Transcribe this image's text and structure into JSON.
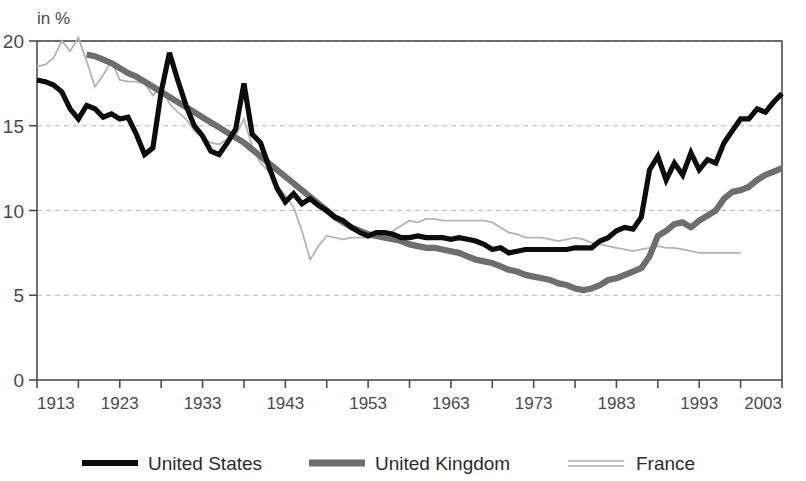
{
  "chart_data": {
    "type": "line",
    "title": "",
    "subtitle": "",
    "unit_label": "in %",
    "xlabel": "",
    "ylabel": "",
    "xlim": [
      1913,
      2003
    ],
    "ylim": [
      0,
      20
    ],
    "y_ticks": [
      "0",
      "5",
      "10",
      "15",
      "20"
    ],
    "y_tick_values": [
      0,
      5,
      10,
      15,
      20
    ],
    "x_ticks": [
      "1913",
      "1923",
      "1933",
      "1943",
      "1953",
      "1963",
      "1973",
      "1983",
      "1993",
      "2003"
    ],
    "x_tick_values": [
      1913,
      1923,
      1933,
      1943,
      1953,
      1963,
      1973,
      1983,
      1993,
      2003
    ],
    "x_minor_tick_values": [
      1918,
      1928,
      1938,
      1948,
      1958,
      1968,
      1978,
      1988,
      1998
    ],
    "grid": "horizontal-dashed",
    "legend_position": "bottom",
    "colors": {
      "united_states": "#0d0d0d",
      "united_kingdom": "#6e6e6e",
      "france": "#b4b4b4",
      "gridline": "#b9b9b9",
      "axis": "#4d4d4d",
      "background": "#ffffff"
    },
    "series": [
      {
        "name": "United States",
        "color": "#0d0d0d",
        "x": [
          1913,
          1914,
          1915,
          1916,
          1917,
          1918,
          1919,
          1920,
          1921,
          1922,
          1923,
          1924,
          1925,
          1926,
          1927,
          1928,
          1929,
          1930,
          1931,
          1932,
          1933,
          1934,
          1935,
          1936,
          1937,
          1938,
          1939,
          1940,
          1941,
          1942,
          1943,
          1944,
          1945,
          1946,
          1947,
          1948,
          1949,
          1950,
          1951,
          1952,
          1953,
          1954,
          1955,
          1956,
          1957,
          1958,
          1959,
          1960,
          1961,
          1962,
          1963,
          1964,
          1965,
          1966,
          1967,
          1968,
          1969,
          1970,
          1971,
          1972,
          1973,
          1974,
          1975,
          1976,
          1977,
          1978,
          1979,
          1980,
          1981,
          1982,
          1983,
          1984,
          1985,
          1986,
          1987,
          1988,
          1989,
          1990,
          1991,
          1992,
          1993,
          1994,
          1995,
          1996,
          1997,
          1998,
          1999,
          2000,
          2001,
          2002,
          2003
        ],
        "values": [
          17.7,
          17.6,
          17.4,
          17.0,
          16.0,
          15.4,
          16.2,
          16.0,
          15.5,
          15.7,
          15.4,
          15.5,
          14.5,
          13.3,
          13.7,
          17.0,
          19.3,
          17.7,
          16.2,
          15.0,
          14.4,
          13.5,
          13.3,
          14.0,
          14.8,
          17.5,
          14.5,
          14.0,
          12.6,
          11.3,
          10.5,
          11.0,
          10.4,
          10.7,
          10.3,
          10.0,
          9.6,
          9.4,
          9.0,
          8.7,
          8.5,
          8.7,
          8.7,
          8.6,
          8.4,
          8.4,
          8.5,
          8.4,
          8.4,
          8.4,
          8.3,
          8.4,
          8.3,
          8.2,
          8.0,
          7.7,
          7.8,
          7.5,
          7.6,
          7.7,
          7.7,
          7.7,
          7.7,
          7.7,
          7.7,
          7.8,
          7.8,
          7.8,
          8.2,
          8.4,
          8.8,
          9.0,
          8.9,
          9.6,
          12.4,
          13.2,
          11.8,
          12.8,
          12.1,
          13.4,
          12.4,
          13.0,
          12.8,
          14.0,
          14.7,
          15.4,
          15.4,
          16.0,
          15.8,
          16.4,
          16.9
        ]
      },
      {
        "name": "United Kingdom",
        "color": "#6e6e6e",
        "x": [
          1919,
          1920,
          1921,
          1922,
          1923,
          1924,
          1925,
          1926,
          1927,
          1928,
          1929,
          1930,
          1931,
          1932,
          1933,
          1934,
          1935,
          1936,
          1937,
          1938,
          1939,
          1940,
          1941,
          1942,
          1943,
          1944,
          1945,
          1946,
          1947,
          1948,
          1949,
          1950,
          1951,
          1952,
          1953,
          1954,
          1955,
          1956,
          1957,
          1958,
          1959,
          1960,
          1961,
          1962,
          1963,
          1964,
          1965,
          1966,
          1967,
          1968,
          1969,
          1970,
          1971,
          1972,
          1973,
          1974,
          1975,
          1976,
          1977,
          1978,
          1979,
          1980,
          1981,
          1982,
          1983,
          1984,
          1985,
          1986,
          1987,
          1988,
          1989,
          1990,
          1991,
          1992,
          1993,
          1994,
          1995,
          1996,
          1997,
          1998,
          1999,
          2000,
          2001,
          2002,
          2003
        ],
        "values": [
          19.2,
          19.1,
          18.9,
          18.7,
          18.4,
          18.1,
          17.9,
          17.6,
          17.3,
          17.0,
          16.7,
          16.4,
          16.1,
          15.8,
          15.5,
          15.2,
          14.9,
          14.6,
          14.3,
          14.0,
          13.6,
          13.2,
          12.8,
          12.4,
          12.0,
          11.6,
          11.2,
          10.8,
          10.4,
          10.0,
          9.6,
          9.3,
          9.0,
          8.8,
          8.6,
          8.5,
          8.4,
          8.3,
          8.2,
          8.0,
          7.9,
          7.8,
          7.8,
          7.7,
          7.6,
          7.5,
          7.3,
          7.1,
          7.0,
          6.9,
          6.7,
          6.5,
          6.4,
          6.2,
          6.1,
          6.0,
          5.9,
          5.7,
          5.6,
          5.4,
          5.3,
          5.4,
          5.6,
          5.9,
          6.0,
          6.2,
          6.4,
          6.6,
          7.3,
          8.5,
          8.8,
          9.2,
          9.3,
          9.0,
          9.4,
          9.7,
          10.0,
          10.7,
          11.1,
          11.2,
          11.4,
          11.8,
          12.1,
          12.3,
          12.5
        ]
      },
      {
        "name": "France",
        "color": "#b4b4b4",
        "x": [
          1913,
          1914,
          1915,
          1916,
          1917,
          1918,
          1919,
          1920,
          1921,
          1922,
          1923,
          1924,
          1925,
          1926,
          1927,
          1928,
          1929,
          1930,
          1931,
          1932,
          1933,
          1934,
          1935,
          1936,
          1937,
          1938,
          1939,
          1940,
          1941,
          1942,
          1943,
          1944,
          1945,
          1946,
          1947,
          1948,
          1949,
          1950,
          1951,
          1952,
          1953,
          1954,
          1955,
          1956,
          1957,
          1958,
          1959,
          1960,
          1961,
          1962,
          1963,
          1964,
          1965,
          1966,
          1967,
          1968,
          1969,
          1970,
          1971,
          1972,
          1973,
          1974,
          1975,
          1976,
          1977,
          1978,
          1979,
          1980,
          1981,
          1982,
          1983,
          1984,
          1985,
          1986,
          1987,
          1988,
          1989,
          1990,
          1991,
          1992,
          1993,
          1994,
          1995,
          1996,
          1997,
          1998
        ],
        "values": [
          18.5,
          18.6,
          19.0,
          20.0,
          19.4,
          20.2,
          18.8,
          17.3,
          18.0,
          18.8,
          17.7,
          17.6,
          17.6,
          17.5,
          16.8,
          17.3,
          16.3,
          15.8,
          15.4,
          14.7,
          14.3,
          14.0,
          13.9,
          14.2,
          14.4,
          15.4,
          13.8,
          12.8,
          12.3,
          11.5,
          10.9,
          10.2,
          8.8,
          7.1,
          7.9,
          8.5,
          8.4,
          8.3,
          8.4,
          8.4,
          8.4,
          8.5,
          8.6,
          8.8,
          9.1,
          9.4,
          9.3,
          9.5,
          9.5,
          9.4,
          9.4,
          9.4,
          9.4,
          9.4,
          9.4,
          9.3,
          9.0,
          8.7,
          8.6,
          8.4,
          8.4,
          8.4,
          8.3,
          8.2,
          8.3,
          8.4,
          8.3,
          8.1,
          8.0,
          7.9,
          7.8,
          7.7,
          7.6,
          7.7,
          7.8,
          7.9,
          7.8,
          7.8,
          7.7,
          7.6,
          7.5,
          7.5,
          7.5,
          7.5,
          7.5,
          7.5
        ]
      }
    ]
  },
  "legend": {
    "items": [
      {
        "label": "United States",
        "swatch": "us"
      },
      {
        "label": "United Kingdom",
        "swatch": "uk"
      },
      {
        "label": "France",
        "swatch": "fr"
      }
    ]
  }
}
